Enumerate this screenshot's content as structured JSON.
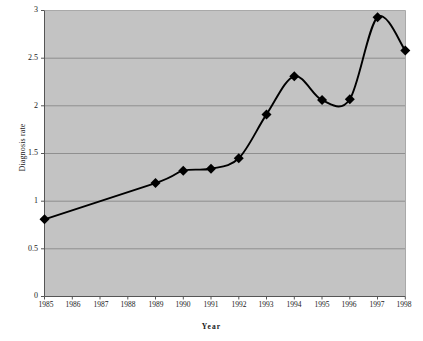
{
  "chart_data": {
    "type": "line",
    "title": "",
    "xlabel": "Year",
    "ylabel": "Diagnosis rate",
    "categories": [
      "1985",
      "1986",
      "1987",
      "1988",
      "1989",
      "1990",
      "1991",
      "1992",
      "1993",
      "1994",
      "1995",
      "1996",
      "1997",
      "1998"
    ],
    "x": [
      1985,
      1986,
      1987,
      1988,
      1989,
      1990,
      1991,
      1992,
      1993,
      1994,
      1995,
      1996,
      1997,
      1998
    ],
    "values": [
      0.81,
      null,
      null,
      null,
      1.19,
      1.32,
      1.34,
      1.45,
      1.91,
      2.31,
      2.06,
      2.07,
      2.93,
      2.58
    ],
    "markers_at": [
      1985,
      1989,
      1990,
      1991,
      1992,
      1993,
      1994,
      1995,
      1996,
      1997,
      1998
    ],
    "series": [
      {
        "name": "Diagnosis rate",
        "points": [
          {
            "x": "1985",
            "y": 0.81
          },
          {
            "x": "1989",
            "y": 1.19
          },
          {
            "x": "1990",
            "y": 1.32
          },
          {
            "x": "1991",
            "y": 1.34
          },
          {
            "x": "1992",
            "y": 1.45
          },
          {
            "x": "1993",
            "y": 1.91
          },
          {
            "x": "1994",
            "y": 2.31
          },
          {
            "x": "1995",
            "y": 2.06
          },
          {
            "x": "1996",
            "y": 2.07
          },
          {
            "x": "1997",
            "y": 2.93
          },
          {
            "x": "1998",
            "y": 2.58
          }
        ],
        "line_color": "#000000",
        "marker_color": "#000000",
        "marker_shape": "diamond",
        "smoothed": true
      }
    ],
    "ylim": [
      0,
      3
    ],
    "yticks": [
      0,
      0.5,
      1,
      1.5,
      2,
      2.5,
      3
    ],
    "ytick_labels": [
      "0",
      "0.5",
      "1",
      "1.5",
      "2",
      "2.5",
      "3"
    ],
    "grid": "horizontal",
    "legend": "none",
    "plot_background": "#c3c3c3",
    "grid_color": "#8f8f8f",
    "axis_color": "#6b6b6b",
    "page_background": "#ffffff"
  }
}
